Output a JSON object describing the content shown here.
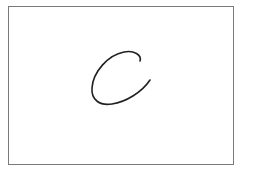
{
  "canvas": {
    "background": "#ffffff",
    "border_color": "#7a7a7a"
  },
  "drawing": {
    "character": "C",
    "stroke_color": "#222222",
    "style": "handwritten"
  }
}
